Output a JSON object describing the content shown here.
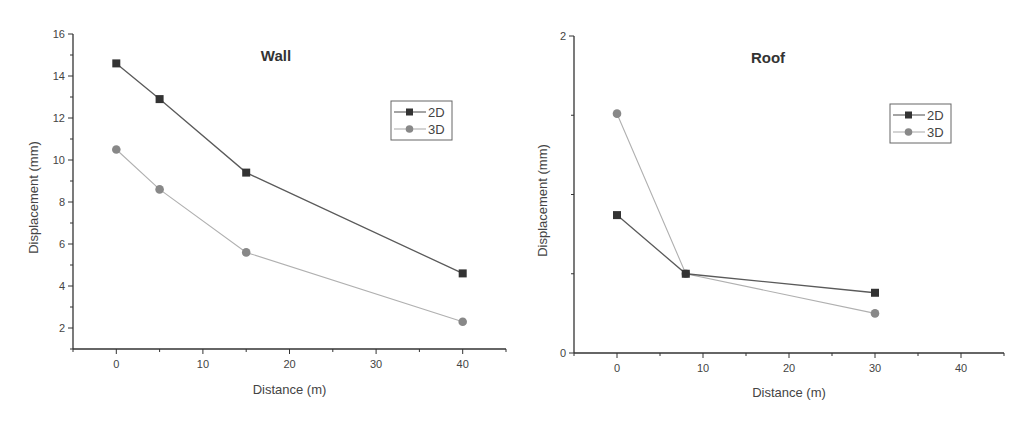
{
  "chart_data": [
    {
      "type": "line",
      "title": "Wall",
      "xlabel": "Distance (m)",
      "ylabel": "Displacement (mm)",
      "xlim": [
        -5,
        45
      ],
      "ylim": [
        1,
        16
      ],
      "xticks": [
        "0",
        "10",
        "20",
        "30",
        "40"
      ],
      "yticks": [
        "2",
        "4",
        "6",
        "8",
        "10",
        "12",
        "14",
        "16"
      ],
      "grid": false,
      "legend_position": "upper right",
      "x": [
        0,
        5,
        15,
        40
      ],
      "series": [
        {
          "name": "2D",
          "marker": "square",
          "values": [
            14.6,
            12.9,
            9.4,
            4.6
          ]
        },
        {
          "name": "3D",
          "marker": "circle",
          "values": [
            10.5,
            8.6,
            5.6,
            2.3
          ]
        }
      ]
    },
    {
      "type": "line",
      "title": "Roof",
      "xlabel": "Distance (m)",
      "ylabel": "Displacement (mm)",
      "xlim": [
        -5,
        45
      ],
      "ylim": [
        0,
        2
      ],
      "xticks": [
        "0",
        "10",
        "20",
        "30",
        "40"
      ],
      "yticks": [
        "0",
        "2"
      ],
      "grid": false,
      "legend_position": "upper right",
      "x": [
        0,
        8,
        30
      ],
      "series": [
        {
          "name": "2D",
          "marker": "square",
          "values": [
            0.87,
            0.5,
            0.38
          ]
        },
        {
          "name": "3D",
          "marker": "circle",
          "values": [
            1.51,
            0.5,
            0.25
          ]
        }
      ]
    }
  ],
  "colors": {
    "series_2d_line": "#5a5a5a",
    "series_2d_marker": "#333333",
    "series_3d_line": "#b0b0b0",
    "series_3d_marker": "#888888",
    "axis": "#333333"
  }
}
